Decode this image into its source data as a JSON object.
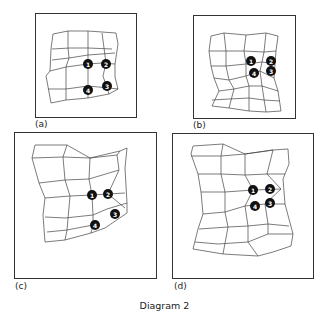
{
  "caption": "Diagram 2",
  "panels": [
    {
      "id": "a",
      "label": "(a)",
      "markers": [
        "1",
        "2",
        "3",
        "4"
      ]
    },
    {
      "id": "b",
      "label": "(b)",
      "markers": [
        "1",
        "2",
        "3",
        "4"
      ]
    },
    {
      "id": "c",
      "label": "(c)",
      "markers": [
        "1",
        "2",
        "3",
        "4"
      ]
    },
    {
      "id": "d",
      "label": "(d)",
      "markers": [
        "1",
        "2",
        "3",
        "4"
      ]
    }
  ]
}
